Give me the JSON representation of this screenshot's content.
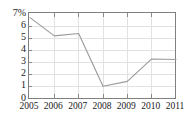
{
  "chart_data": {
    "type": "line",
    "title": "",
    "subtitle": "",
    "xlabel": "",
    "ylabel": "",
    "unit": "%",
    "categories": [
      "2005",
      "2006",
      "2007",
      "2008",
      "2009",
      "2010",
      "2011"
    ],
    "x": [
      2005,
      2006,
      2007,
      2008,
      2009,
      2010,
      2011
    ],
    "values": [
      6.7,
      5.2,
      5.4,
      1.05,
      1.45,
      3.3,
      3.25
    ],
    "series": [
      {
        "name": "",
        "values": [
          6.7,
          5.2,
          5.4,
          1.05,
          1.45,
          3.3,
          3.25
        ]
      }
    ],
    "ylim": [
      0,
      7
    ],
    "xlim": [
      2005,
      2011
    ],
    "ytick_labels": [
      "7%",
      "6",
      "5",
      "4",
      "3",
      "2",
      "1",
      "0"
    ],
    "ytick_values": [
      7,
      6,
      5,
      4,
      3,
      2,
      1,
      0
    ],
    "xtick_labels": [
      "2005",
      "2006",
      "2007",
      "2008",
      "2009",
      "2010",
      "2011"
    ],
    "grid": true,
    "grid_axis": "both",
    "legend": false,
    "legend_position": "none",
    "annotations": [],
    "line_color": "#9a9a9a",
    "grid_color": "#e2e2e2",
    "frame_color": "#808080",
    "background_color": "#ffffff",
    "text_color": "#1a1a1a"
  },
  "axes": {
    "y": {
      "ticks": [
        {
          "label": "7%",
          "value": 7
        },
        {
          "label": "6",
          "value": 6
        },
        {
          "label": "5",
          "value": 5
        },
        {
          "label": "4",
          "value": 4
        },
        {
          "label": "3",
          "value": 3
        },
        {
          "label": "2",
          "value": 2
        },
        {
          "label": "1",
          "value": 1
        },
        {
          "label": "0",
          "value": 0
        }
      ]
    },
    "x": {
      "ticks": [
        {
          "label": "2005",
          "value": 2005
        },
        {
          "label": "2006",
          "value": 2006
        },
        {
          "label": "2007",
          "value": 2007
        },
        {
          "label": "2008",
          "value": 2008
        },
        {
          "label": "2009",
          "value": 2009
        },
        {
          "label": "2010",
          "value": 2010
        },
        {
          "label": "2011",
          "value": 2011
        }
      ]
    }
  }
}
